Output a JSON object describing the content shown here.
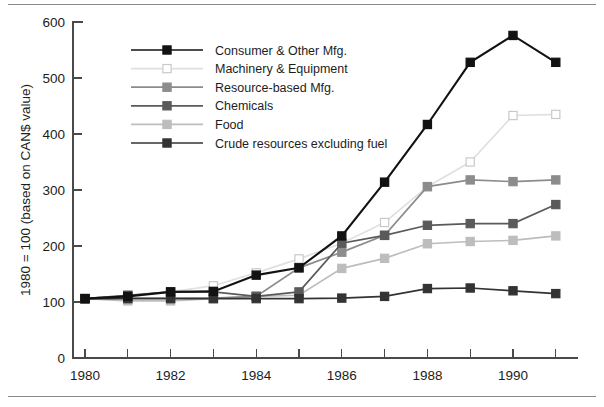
{
  "figure": {
    "has_top_rule": true,
    "has_bottom_rule": true,
    "background": "#ffffff"
  },
  "axes": {
    "y_title": "1980 = 100 (based on CAN$ value)",
    "y_ticks": [
      "0",
      "100",
      "200",
      "300",
      "400",
      "500",
      "600"
    ],
    "x_ticks_labeled": [
      "1980",
      "1982",
      "1984",
      "1986",
      "1988",
      "1990"
    ],
    "x_ticks_all": [
      "1980",
      "1981",
      "1982",
      "1983",
      "1984",
      "1985",
      "1986",
      "1987",
      "1988",
      "1989",
      "1990",
      "1991"
    ]
  },
  "legend": {
    "items": [
      {
        "label": "Consumer & Other Mfg.",
        "color": "#121212",
        "fill": "#121212",
        "marker": "filled"
      },
      {
        "label": "Machinery & Equipment",
        "color": "#e0e0e0",
        "fill": "#f2f2f2",
        "marker": "open"
      },
      {
        "label": "Resource-based Mfg.",
        "color": "#8c8c8c",
        "fill": "#8c8c8c",
        "marker": "filled"
      },
      {
        "label": "Chemicals",
        "color": "#5a5a5a",
        "fill": "#5a5a5a",
        "marker": "filled"
      },
      {
        "label": "Food",
        "color": "#bdbdbd",
        "fill": "#bdbdbd",
        "marker": "filled"
      },
      {
        "label": "Crude resources excluding fuel",
        "color": "#333333",
        "fill": "#333333",
        "marker": "filled"
      }
    ]
  },
  "chart_data": {
    "type": "line",
    "title": "",
    "subtitle": "",
    "xlabel": "",
    "ylabel": "1980 = 100 (based on CAN$ value)",
    "xlim": [
      1980,
      1991
    ],
    "ylim": [
      0,
      600
    ],
    "grid": false,
    "legend_position": "upper-left-inside",
    "x": [
      1980,
      1981,
      1982,
      1983,
      1984,
      1985,
      1986,
      1987,
      1988,
      1989,
      1990,
      1991
    ],
    "series": [
      {
        "name": "Consumer & Other Mfg.",
        "color": "#121212",
        "values": [
          106,
          110,
          118,
          119,
          148,
          161,
          218,
          314,
          417,
          528,
          576,
          528
        ]
      },
      {
        "name": "Machinery & Equipment",
        "color": "#e0e0e0",
        "values": [
          106,
          112,
          118,
          129,
          152,
          177,
          205,
          242,
          306,
          350,
          433,
          435
        ]
      },
      {
        "name": "Resource-based Mfg.",
        "color": "#8c8c8c",
        "values": [
          106,
          107,
          107,
          107,
          110,
          161,
          189,
          219,
          306,
          318,
          315,
          318
        ]
      },
      {
        "name": "Chemicals",
        "color": "#5a5a5a",
        "values": [
          106,
          112,
          118,
          118,
          110,
          118,
          205,
          219,
          237,
          240,
          240,
          274
        ]
      },
      {
        "name": "Food",
        "color": "#bdbdbd",
        "values": [
          106,
          102,
          102,
          106,
          110,
          112,
          160,
          178,
          204,
          208,
          210,
          218
        ]
      },
      {
        "name": "Crude resources excluding fuel",
        "color": "#333333",
        "values": [
          106,
          106,
          106,
          106,
          106,
          106,
          107,
          110,
          124,
          125,
          120,
          115
        ]
      }
    ]
  }
}
